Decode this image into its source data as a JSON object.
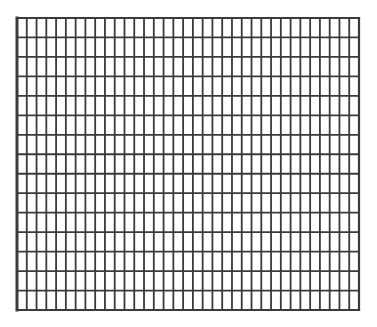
{
  "grid": {
    "columns": 35,
    "rows": 15,
    "line_color": "#3a3a3a",
    "background_color": "#ffffff",
    "line_width": 1.8,
    "border_width": 2.2,
    "left_border_width": 3
  }
}
